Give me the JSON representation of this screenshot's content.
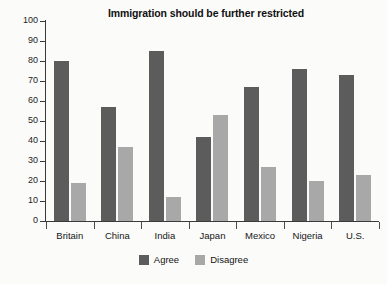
{
  "chart_data": {
    "type": "bar",
    "title": "Immigration should be further restricted",
    "xlabel": "",
    "ylabel": "",
    "ylim": [
      0,
      100
    ],
    "ytick_step": 10,
    "yticks": [
      0,
      10,
      20,
      30,
      40,
      50,
      60,
      70,
      80,
      90,
      100
    ],
    "grid": false,
    "legend_position": "bottom-center",
    "categories": [
      "Britain",
      "China",
      "India",
      "Japan",
      "Mexico",
      "Nigeria",
      "U.S."
    ],
    "series": [
      {
        "name": "Agree",
        "color": "#5c5c5c",
        "values": [
          80,
          57,
          85,
          42,
          67,
          76,
          73
        ]
      },
      {
        "name": "Disagree",
        "color": "#a8a8a8",
        "values": [
          19,
          37,
          12,
          53,
          27,
          20,
          23
        ]
      }
    ]
  },
  "legend": {
    "entries": [
      {
        "label": "Agree"
      },
      {
        "label": "Disagree"
      }
    ]
  },
  "colors": {
    "agree": "#5c5c5c",
    "disagree": "#a8a8a8",
    "axis": "#3a3a3a",
    "background": "#fbfbf9",
    "text": "#1a1a1a"
  }
}
